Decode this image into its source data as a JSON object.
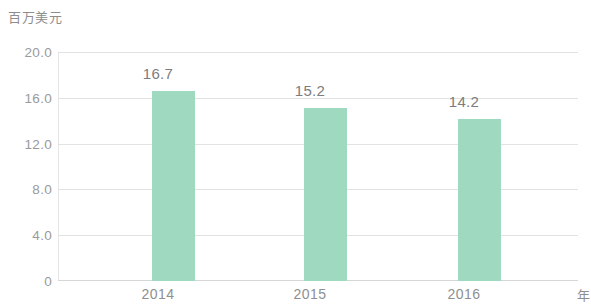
{
  "chart_data": {
    "type": "bar",
    "title": "",
    "subtitle": "",
    "ylabel": "百万美元",
    "xlabel": "年",
    "categories": [
      "2014",
      "2015",
      "2016"
    ],
    "values": [
      16.7,
      15.2,
      14.2
    ],
    "value_labels": [
      "16.7",
      "15.2",
      "14.2"
    ],
    "series": [
      {
        "name": "",
        "values": [
          16.7,
          15.2,
          14.2
        ]
      }
    ],
    "ylim": [
      0,
      20
    ],
    "y_ticks": [
      20.0,
      16.0,
      12.0,
      8.0,
      4.0,
      0
    ],
    "y_tick_labels": [
      "20.0",
      "16.0",
      "12.0",
      "8.0",
      "4.0",
      "0"
    ],
    "grid": true,
    "grid_axis": "y",
    "legend": false,
    "legend_position": "none",
    "bar_color": "#9fd9c0",
    "grid_color": "#e2e2e2",
    "text_color": "#8f8f8f",
    "background_color": "#ffffff"
  }
}
